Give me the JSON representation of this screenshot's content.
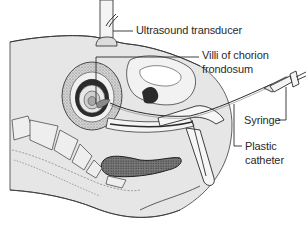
{
  "diagram": {
    "colors": {
      "background": "#ffffff",
      "body_fill": "#e6e6e6",
      "tissue_light": "#f2f2f2",
      "outline": "#3a3a3a",
      "dark_tissue": "#2b2b2b",
      "stipple": "#8a8a8a"
    },
    "labels": [
      {
        "id": "ultrasound-transducer",
        "text": "Ultrasound transducer",
        "x": 135,
        "y": 22
      },
      {
        "id": "villi-line-1",
        "text": "Villi of chorion",
        "x": 204,
        "y": 48
      },
      {
        "id": "villi-line-2",
        "text": "frondosum",
        "x": 204,
        "y": 62
      },
      {
        "id": "syringe",
        "text": "Syringe",
        "x": 245,
        "y": 114
      },
      {
        "id": "plastic-line-1",
        "text": "Plastic",
        "x": 245,
        "y": 141
      },
      {
        "id": "plastic-line-2",
        "text": "catheter",
        "x": 245,
        "y": 155
      }
    ],
    "components": [
      "ultrasound-transducer-probe",
      "abdominal-wall",
      "uterus",
      "chorion-frondosum",
      "bladder",
      "vertebrae",
      "rectum",
      "speculum",
      "plastic-catheter",
      "syringe"
    ]
  }
}
